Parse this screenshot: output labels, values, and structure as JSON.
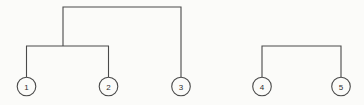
{
  "figure": {
    "kind": "dendrogram",
    "background_color": "#fbfbf9",
    "line_color": "#4a4a4a",
    "label_color": "#2e2e2e",
    "width": 364,
    "height": 105
  },
  "nodes": [
    {
      "id": "1",
      "label": "1",
      "cx": 26.5,
      "cy": 86.5,
      "r": 9.3
    },
    {
      "id": "2",
      "label": "2",
      "cx": 108.5,
      "cy": 86.5,
      "r": 9.3
    },
    {
      "id": "3",
      "label": "3",
      "cx": 181.0,
      "cy": 86.5,
      "r": 9.3
    },
    {
      "id": "4",
      "label": "4",
      "cx": 262.0,
      "cy": 86.5,
      "r": 9.3
    },
    {
      "id": "5",
      "label": "5",
      "cx": 341.0,
      "cy": 86.5,
      "r": 9.3
    }
  ],
  "links": [
    {
      "id": "merge-1-2",
      "name": "bracket-nodes-1-2",
      "members": [
        "1",
        "2"
      ],
      "join_y": 46,
      "left_x": 26.5,
      "right_x": 108.5,
      "path": "M26.5,77.2 L26.5,46 L108.5,46 L108.5,77.2"
    },
    {
      "id": "merge-12-3",
      "name": "bracket-cluster12-node3",
      "members": [
        "1-2",
        "3"
      ],
      "join_y": 7,
      "left_x": 63.0,
      "right_x": 181.0,
      "path": "M63,46 L63,7 L181,7 L181,77.2"
    },
    {
      "id": "merge-4-5",
      "name": "bracket-nodes-4-5",
      "members": [
        "4",
        "5"
      ],
      "join_y": 46,
      "left_x": 262.0,
      "right_x": 341.0,
      "path": "M262,77.2 L262,46 L341,46 L341,77.2"
    }
  ],
  "clusters": [
    {
      "id": "cluster-a",
      "label": "",
      "members": [
        "1",
        "2",
        "3"
      ]
    },
    {
      "id": "cluster-b",
      "label": "",
      "members": [
        "4",
        "5"
      ]
    }
  ]
}
